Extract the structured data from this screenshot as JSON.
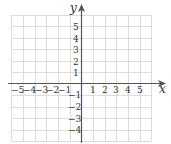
{
  "figure": {
    "type": "coordinate-grid",
    "x_axis_label": "x",
    "y_axis_label": "y",
    "x_ticks": [
      "−5",
      "−4",
      "−3",
      "−2",
      "−1",
      "1",
      "2",
      "3",
      "4",
      "5"
    ],
    "y_ticks_positive": [
      "5",
      "4",
      "3",
      "2",
      "1"
    ],
    "y_ticks_negative": [
      "−1",
      "−2",
      "−3",
      "−4"
    ],
    "x_range": [
      -6,
      6
    ],
    "y_range": [
      -5,
      6
    ],
    "grid": true,
    "colors": {
      "grid": "#d9d9d9",
      "axis": "#555555",
      "text": "#333333"
    }
  }
}
